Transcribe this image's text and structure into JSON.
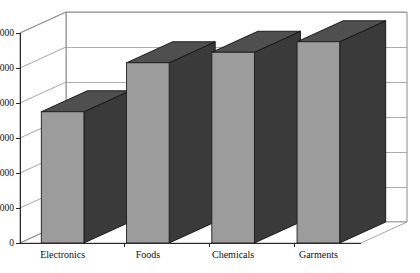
{
  "chart_data": {
    "type": "bar",
    "title": "",
    "subtitle": "",
    "xlabel": "",
    "ylabel": "",
    "categories": [
      "Electronics",
      "Foods",
      "Chemicals",
      "Garments"
    ],
    "values": [
      7500,
      10300,
      10900,
      11500
    ],
    "series": [
      {
        "name": "Series 1",
        "values": [
          7500,
          10300,
          10900,
          11500
        ]
      }
    ],
    "ylim": [
      0,
      12000
    ],
    "ytick_values": [
      0,
      2000,
      4000,
      6000,
      8000,
      10000,
      12000
    ],
    "ytick_labels": [
      "0",
      "2000",
      "4000",
      "6000",
      "8000",
      "10000",
      "12000"
    ],
    "grid": true,
    "grid_axis": "y",
    "legend": false,
    "legend_position": "none",
    "style": "3d-column",
    "colors": {
      "bar_front": "#9c9c9c",
      "bar_side": "#3a3a3a",
      "bar_top": "#4f4f4f",
      "bar_outline": "#1c1c1c",
      "gridline": "#9a9a9a",
      "axis": "#2a2a2a",
      "wall": "#ffffff",
      "text": "#101010",
      "background": "#ffffff"
    }
  }
}
